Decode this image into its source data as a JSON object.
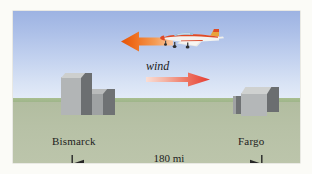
{
  "figure": {
    "type": "physics-diagram",
    "scene_description": "airplane-flying-against-wind-between-two-cities",
    "sky_color_top": "#9db3e2",
    "sky_color_bottom": "#e3ebf8",
    "ground_color": "#b7c1a6",
    "horizon_band_color": "#a9bf90",
    "building_color_light": "#b4b7b8",
    "building_color_dark": "#6c6f71",
    "building_color_top": "#cdcfce"
  },
  "labels": {
    "city_left": "Bismarck",
    "city_right": "Fargo",
    "wind": "wind",
    "distance": "180 mi"
  },
  "vectors": [
    {
      "name": "airspeed-arrow",
      "direction": "left",
      "color_tip": "#e8590c",
      "color_tail": "#f7b38a",
      "attached_to": "airplane"
    },
    {
      "name": "wind-arrow",
      "direction": "right",
      "color_tip": "#e8413c",
      "color_tail": "#f6cfc6",
      "label": "wind"
    }
  ],
  "airplane": {
    "name": "airplane",
    "heading": "right",
    "fuselage_color": "#e14a2b",
    "body_color": "#f2f2ef",
    "canopy_color": "#8fb9d6",
    "stripe_color": "#d94a28"
  },
  "dimension": {
    "value": "180 mi",
    "from": "Bismarck",
    "to": "Fargo",
    "line_color": "#2b2b2b"
  }
}
